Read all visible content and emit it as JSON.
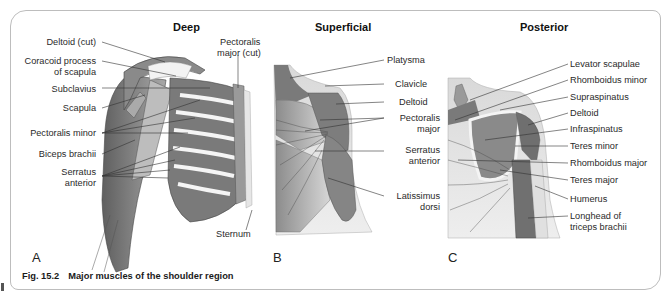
{
  "figure": {
    "number": "Fig. 15.2",
    "caption": "Major muscles of the shoulder region"
  },
  "panels": [
    {
      "id": "A",
      "title": "Deep",
      "letter": "A",
      "labels": [
        "Deltoid (cut)",
        "Coracoid process",
        "of scapula",
        "Subclavius",
        "Scapula",
        "Pectoralis minor",
        "Biceps brachii",
        "Serratus",
        "anterior",
        "Pectoralis",
        "major (cut)",
        "Sternum"
      ]
    },
    {
      "id": "B",
      "title": "Superficial",
      "letter": "B",
      "labels": [
        "Platysma",
        "Clavicle",
        "Deltoid",
        "Pectoralis",
        "major",
        "Serratus",
        "anterior",
        "Latissimus",
        "dorsi"
      ]
    },
    {
      "id": "C",
      "title": "Posterior",
      "letter": "C",
      "labels": [
        "Levator scapulae",
        "Rhomboidus minor",
        "Supraspinatus",
        "Deltoid",
        "Infraspinatus",
        "Teres minor",
        "Rhomboidus major",
        "Teres major",
        "Humerus",
        "Longhead of",
        "triceps brachii"
      ]
    }
  ],
  "colors": {
    "muscle_dark": "#6e6e6e",
    "muscle_mid": "#9a9a9a",
    "muscle_light": "#c8c8c8",
    "skin": "#e2e2e2",
    "bone": "#f4f4f4",
    "frame": "#bdbdbd",
    "leader": "#333333"
  }
}
